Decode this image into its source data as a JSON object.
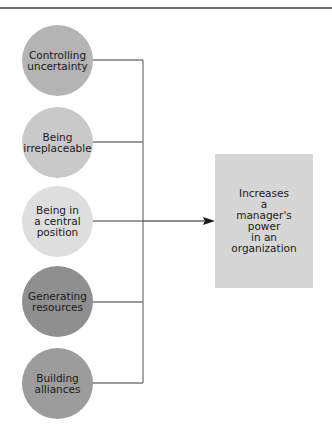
{
  "diagram": {
    "factors": [
      {
        "label": "Controlling\nuncertainty",
        "color": "#b4b4b4"
      },
      {
        "label": "Being\nirreplaceable",
        "color": "#c9c9c9"
      },
      {
        "label": "Being in\na central\nposition",
        "color": "#dedede"
      },
      {
        "label": "Generating\nresources",
        "color": "#8f8f8f"
      },
      {
        "label": "Building\nalliances",
        "color": "#9c9c9c"
      }
    ],
    "outcome": {
      "label": "Increases\na\nmanager's\npower\nin an\norganization",
      "color": "#d6d6d6"
    },
    "line_color": "#7a7a7a",
    "arrow_color": "#1a1a1a"
  }
}
